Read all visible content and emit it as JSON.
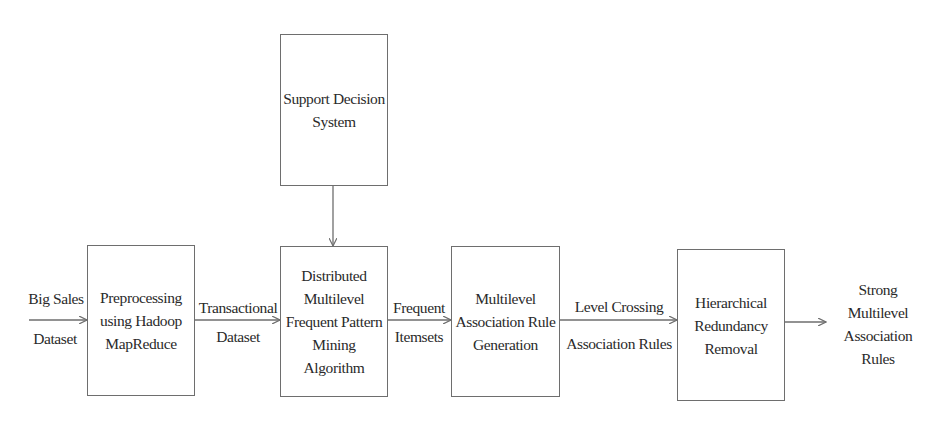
{
  "diagram": {
    "type": "flowchart",
    "nodes": [
      {
        "id": "preprocess",
        "lines": [
          "Preprocessing",
          "using Hadoop",
          "MapReduce"
        ]
      },
      {
        "id": "support",
        "lines": [
          "Support Decision",
          "System"
        ]
      },
      {
        "id": "mining",
        "lines": [
          "Distributed",
          "Multilevel",
          "Frequent Pattern",
          "Mining",
          "Algorithm"
        ]
      },
      {
        "id": "rulegen",
        "lines": [
          "Multilevel",
          "Association Rule",
          "Generation"
        ]
      },
      {
        "id": "redundancy",
        "lines": [
          "Hierarchical",
          "Redundancy",
          "Removal"
        ]
      }
    ],
    "edge_labels": {
      "input_top": "Big Sales",
      "input_bottom": "Dataset",
      "e1_top": "Transactional",
      "e1_bottom": "Dataset",
      "e2_top": "Frequent",
      "e2_bottom": "Itemsets",
      "e3_top": "Level Crossing",
      "e3_bottom": "Association Rules"
    },
    "output": [
      "Strong",
      "Multilevel",
      "Association",
      "Rules"
    ],
    "edges": [
      {
        "from": "input",
        "to": "preprocess"
      },
      {
        "from": "preprocess",
        "to": "mining"
      },
      {
        "from": "support",
        "to": "mining"
      },
      {
        "from": "mining",
        "to": "rulegen"
      },
      {
        "from": "rulegen",
        "to": "redundancy"
      },
      {
        "from": "redundancy",
        "to": "output"
      }
    ]
  }
}
